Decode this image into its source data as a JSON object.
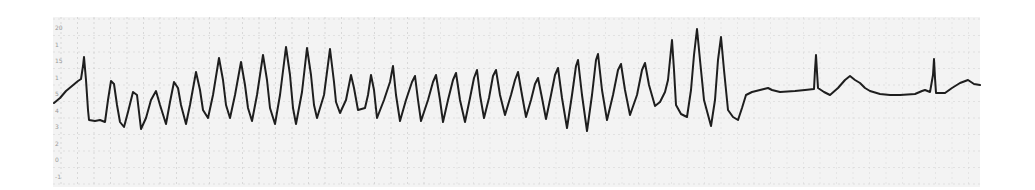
{
  "strip": {
    "type": "ecg-rhythm-strip",
    "description": "Polymorphic ventricular tachycardia (torsades-like) terminating to sinus rhythm",
    "paper_color": "#f3f3f3",
    "grid_color": "#c8c8c8",
    "trace_color": "#1e1e1e",
    "grid_spacing_px": 16.5,
    "bounds": {
      "left": 53,
      "top": 17,
      "right": 980,
      "bottom": 187
    }
  },
  "scale_marks": [
    "20",
    "1",
    "15",
    "1",
    "5",
    "4",
    "3",
    "2",
    "0",
    "-1",
    "-2",
    "-3",
    "-4",
    "-5"
  ],
  "trace": {
    "points": [
      [
        54,
        103
      ],
      [
        60,
        98
      ],
      [
        66,
        91
      ],
      [
        72,
        86
      ],
      [
        78,
        81
      ],
      [
        81,
        79
      ],
      [
        83,
        66
      ],
      [
        84,
        57
      ],
      [
        86,
        80
      ],
      [
        88,
        110
      ],
      [
        89,
        120
      ],
      [
        95,
        121
      ],
      [
        100,
        120
      ],
      [
        105,
        122
      ],
      [
        108,
        100
      ],
      [
        111,
        81
      ],
      [
        114,
        84
      ],
      [
        117,
        105
      ],
      [
        120,
        122
      ],
      [
        124,
        127
      ],
      [
        128,
        112
      ],
      [
        133,
        92
      ],
      [
        137,
        95
      ],
      [
        139,
        112
      ],
      [
        141,
        129
      ],
      [
        146,
        118
      ],
      [
        151,
        100
      ],
      [
        156,
        91
      ],
      [
        160,
        105
      ],
      [
        166,
        124
      ],
      [
        170,
        102
      ],
      [
        174,
        82
      ],
      [
        178,
        88
      ],
      [
        181,
        105
      ],
      [
        186,
        124
      ],
      [
        190,
        105
      ],
      [
        196,
        72
      ],
      [
        200,
        90
      ],
      [
        203,
        110
      ],
      [
        208,
        118
      ],
      [
        213,
        95
      ],
      [
        219,
        58
      ],
      [
        223,
        80
      ],
      [
        226,
        105
      ],
      [
        230,
        118
      ],
      [
        235,
        95
      ],
      [
        241,
        62
      ],
      [
        245,
        85
      ],
      [
        248,
        108
      ],
      [
        252,
        121
      ],
      [
        257,
        95
      ],
      [
        263,
        55
      ],
      [
        267,
        80
      ],
      [
        270,
        108
      ],
      [
        275,
        124
      ],
      [
        280,
        95
      ],
      [
        286,
        47
      ],
      [
        290,
        75
      ],
      [
        293,
        108
      ],
      [
        296,
        124
      ],
      [
        302,
        92
      ],
      [
        307,
        48
      ],
      [
        311,
        75
      ],
      [
        314,
        105
      ],
      [
        317,
        118
      ],
      [
        324,
        95
      ],
      [
        330,
        49
      ],
      [
        334,
        82
      ],
      [
        336,
        102
      ],
      [
        340,
        113
      ],
      [
        346,
        100
      ],
      [
        351,
        75
      ],
      [
        354,
        88
      ],
      [
        358,
        110
      ],
      [
        365,
        108
      ],
      [
        368,
        95
      ],
      [
        371,
        75
      ],
      [
        374,
        90
      ],
      [
        377,
        118
      ],
      [
        384,
        100
      ],
      [
        390,
        82
      ],
      [
        393,
        66
      ],
      [
        396,
        95
      ],
      [
        400,
        121
      ],
      [
        406,
        100
      ],
      [
        412,
        82
      ],
      [
        415,
        76
      ],
      [
        418,
        100
      ],
      [
        421,
        121
      ],
      [
        428,
        100
      ],
      [
        433,
        82
      ],
      [
        436,
        75
      ],
      [
        440,
        100
      ],
      [
        443,
        122
      ],
      [
        448,
        100
      ],
      [
        453,
        80
      ],
      [
        456,
        73
      ],
      [
        460,
        100
      ],
      [
        465,
        122
      ],
      [
        470,
        98
      ],
      [
        474,
        78
      ],
      [
        477,
        70
      ],
      [
        480,
        95
      ],
      [
        484,
        118
      ],
      [
        489,
        98
      ],
      [
        493,
        76
      ],
      [
        496,
        70
      ],
      [
        500,
        95
      ],
      [
        505,
        115
      ],
      [
        511,
        95
      ],
      [
        515,
        80
      ],
      [
        518,
        72
      ],
      [
        522,
        95
      ],
      [
        526,
        117
      ],
      [
        531,
        100
      ],
      [
        535,
        84
      ],
      [
        538,
        78
      ],
      [
        542,
        98
      ],
      [
        546,
        119
      ],
      [
        551,
        95
      ],
      [
        555,
        75
      ],
      [
        558,
        68
      ],
      [
        562,
        98
      ],
      [
        567,
        128
      ],
      [
        572,
        95
      ],
      [
        576,
        66
      ],
      [
        578,
        60
      ],
      [
        582,
        95
      ],
      [
        587,
        131
      ],
      [
        592,
        95
      ],
      [
        596,
        60
      ],
      [
        598,
        54
      ],
      [
        602,
        90
      ],
      [
        607,
        120
      ],
      [
        613,
        95
      ],
      [
        618,
        70
      ],
      [
        621,
        64
      ],
      [
        625,
        90
      ],
      [
        630,
        115
      ],
      [
        637,
        95
      ],
      [
        642,
        70
      ],
      [
        645,
        63
      ],
      [
        649,
        85
      ],
      [
        655,
        106
      ],
      [
        660,
        102
      ],
      [
        665,
        92
      ],
      [
        668,
        80
      ],
      [
        670,
        60
      ],
      [
        672,
        40
      ],
      [
        674,
        70
      ],
      [
        676,
        105
      ],
      [
        681,
        114
      ],
      [
        687,
        117
      ],
      [
        691,
        90
      ],
      [
        694,
        55
      ],
      [
        697,
        29
      ],
      [
        700,
        60
      ],
      [
        704,
        100
      ],
      [
        711,
        126
      ],
      [
        715,
        100
      ],
      [
        718,
        60
      ],
      [
        721,
        37
      ],
      [
        724,
        70
      ],
      [
        728,
        110
      ],
      [
        733,
        117
      ],
      [
        738,
        120
      ],
      [
        742,
        108
      ],
      [
        746,
        95
      ],
      [
        752,
        92
      ],
      [
        760,
        90
      ],
      [
        768,
        88
      ],
      [
        772,
        90
      ],
      [
        780,
        92
      ],
      [
        795,
        91
      ],
      [
        805,
        90
      ],
      [
        814,
        89
      ],
      [
        815,
        70
      ],
      [
        816,
        55
      ],
      [
        817,
        72
      ],
      [
        818,
        88
      ],
      [
        824,
        92
      ],
      [
        830,
        95
      ],
      [
        838,
        88
      ],
      [
        845,
        80
      ],
      [
        850,
        76
      ],
      [
        855,
        80
      ],
      [
        860,
        83
      ],
      [
        865,
        88
      ],
      [
        870,
        91
      ],
      [
        880,
        94
      ],
      [
        890,
        95
      ],
      [
        900,
        95
      ],
      [
        915,
        94
      ],
      [
        922,
        91
      ],
      [
        925,
        90
      ],
      [
        930,
        92
      ],
      [
        933,
        75
      ],
      [
        934,
        59
      ],
      [
        935,
        78
      ],
      [
        936,
        93
      ],
      [
        945,
        93
      ],
      [
        952,
        88
      ],
      [
        960,
        83
      ],
      [
        968,
        80
      ],
      [
        974,
        84
      ],
      [
        980,
        85
      ]
    ],
    "stroke_width": 2
  }
}
